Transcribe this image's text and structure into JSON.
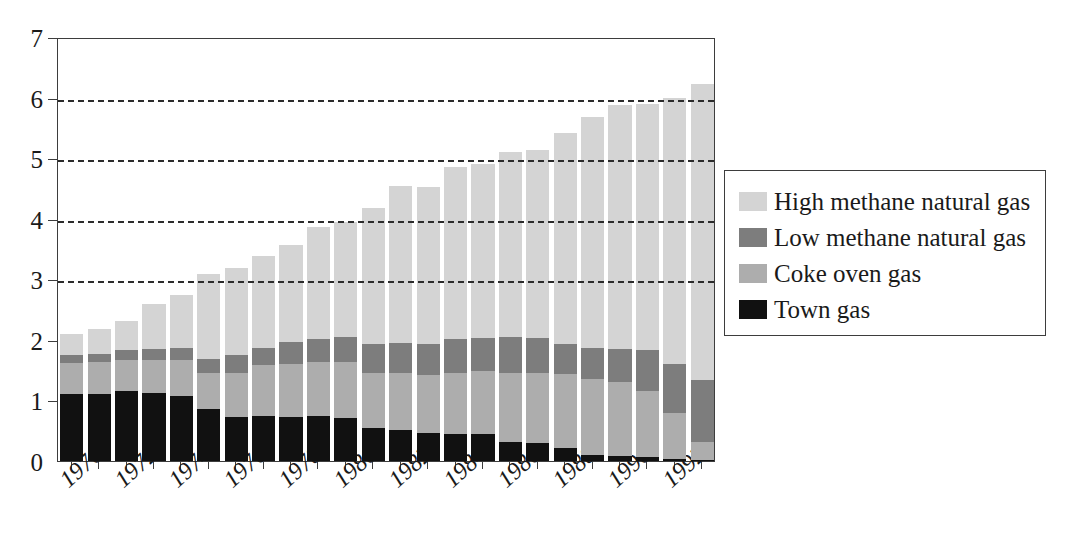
{
  "chart_data": {
    "type": "bar",
    "subtype": "stacked-bar",
    "title": "",
    "xlabel": "",
    "ylabel": "",
    "ylim": [
      0,
      7
    ],
    "yticks": [
      0,
      1,
      2,
      3,
      4,
      5,
      6,
      7
    ],
    "ytick_labels": [
      "0",
      "1",
      "2",
      "3",
      "4",
      "5",
      "6",
      "7"
    ],
    "gridlines": [
      3,
      4,
      5,
      6
    ],
    "grid": true,
    "grid_style": "dashed",
    "legend_position": "right",
    "categories": [
      1970,
      1971,
      1972,
      1973,
      1974,
      1975,
      1976,
      1977,
      1978,
      1979,
      1980,
      1981,
      1982,
      1983,
      1984,
      1985,
      1986,
      1987,
      1988,
      1989,
      1990,
      1991,
      1992,
      1993
    ],
    "tick_labels": [
      "1970",
      "",
      "1972",
      "",
      "1974",
      "",
      "1976",
      "",
      "1978",
      "",
      "1980",
      "",
      "1982",
      "",
      "1984",
      "",
      "1986",
      "",
      "1988",
      "",
      "1990",
      "",
      "1992",
      ""
    ],
    "visible_tick_labels": [
      "1970",
      "1972",
      "1974",
      "1976",
      "1978",
      "1980",
      "1982",
      "1984",
      "1986",
      "1988",
      "1990",
      "1992"
    ],
    "series": [
      {
        "name": "Town gas",
        "color": "#111111",
        "values": [
          1.1,
          1.11,
          1.15,
          1.12,
          1.08,
          0.86,
          0.72,
          0.74,
          0.72,
          0.74,
          0.71,
          0.55,
          0.52,
          0.46,
          0.44,
          0.45,
          0.31,
          0.3,
          0.22,
          0.1,
          0.08,
          0.06,
          0.04,
          0.02
        ]
      },
      {
        "name": "Coke oven gas",
        "color": "#adadad",
        "values": [
          0.51,
          0.53,
          0.52,
          0.55,
          0.58,
          0.6,
          0.74,
          0.84,
          0.88,
          0.9,
          0.93,
          0.91,
          0.94,
          0.96,
          1.01,
          1.03,
          1.14,
          1.15,
          1.21,
          1.25,
          1.22,
          1.09,
          0.75,
          0.29
        ]
      },
      {
        "name": "Low methane natural gas",
        "color": "#7d7d7d",
        "values": [
          0.14,
          0.13,
          0.16,
          0.18,
          0.2,
          0.22,
          0.29,
          0.28,
          0.36,
          0.38,
          0.41,
          0.48,
          0.49,
          0.52,
          0.57,
          0.55,
          0.59,
          0.58,
          0.5,
          0.52,
          0.55,
          0.68,
          0.82,
          1.02
        ]
      },
      {
        "name": "High methane natural gas",
        "color": "#d4d4d4",
        "values": [
          0.35,
          0.41,
          0.49,
          0.75,
          0.88,
          1.4,
          1.44,
          1.52,
          1.6,
          1.84,
          1.9,
          2.24,
          2.59,
          2.59,
          2.83,
          2.87,
          3.07,
          3.11,
          3.49,
          3.81,
          4.02,
          4.07,
          4.39,
          4.9
        ]
      }
    ],
    "totals": [
      2.1,
      2.18,
      2.32,
      2.6,
      2.74,
      3.08,
      3.19,
      3.38,
      3.56,
      3.86,
      3.95,
      4.18,
      4.54,
      4.53,
      4.85,
      4.9,
      5.11,
      5.14,
      5.42,
      5.68,
      5.87,
      5.9,
      6.0,
      6.23
    ]
  },
  "legend": {
    "items": [
      {
        "label": "High methane natural gas",
        "color": "#d4d4d4"
      },
      {
        "label": "Low methane natural gas",
        "color": "#7d7d7d"
      },
      {
        "label": "Coke oven gas",
        "color": "#adadad"
      },
      {
        "label": "Town gas",
        "color": "#111111"
      }
    ]
  }
}
